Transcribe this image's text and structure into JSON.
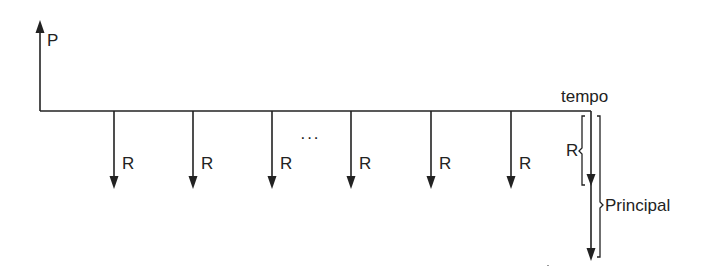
{
  "diagram": {
    "labels": {
      "present_value": "P",
      "time_axis": "tempo",
      "payment": "R",
      "ellipsis": "···",
      "final_payment": "R",
      "principal": "Principal"
    },
    "payments": [
      {
        "label": "R",
        "x": 114
      },
      {
        "label": "R",
        "x": 193
      },
      {
        "label": "R",
        "x": 272
      },
      {
        "label": "R",
        "x": 351
      },
      {
        "label": "R",
        "x": 431
      },
      {
        "label": "R",
        "x": 511
      }
    ],
    "line_color": "#222222"
  }
}
